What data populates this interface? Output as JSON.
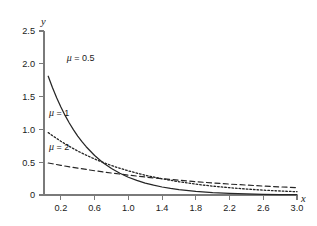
{
  "chart_data": {
    "type": "line",
    "title": "",
    "subtitle": "",
    "xlabel": "x",
    "ylabel": "y",
    "xlim": [
      0,
      3.0
    ],
    "ylim": [
      0,
      2.5
    ],
    "grid": false,
    "legend_position": "inline-annotations",
    "x_ticks": [
      0.2,
      0.6,
      1.0,
      1.4,
      1.8,
      2.2,
      2.6,
      3.0
    ],
    "x_tick_labels": [
      "0.2",
      "0.6",
      "1.0",
      "1.4",
      "1.8",
      "2.2",
      "2.6",
      "3.0"
    ],
    "y_ticks": [
      0,
      0.5,
      1.0,
      1.5,
      2.0,
      2.5
    ],
    "y_tick_labels": [
      "0",
      "0.5",
      "1.0",
      "1.5",
      "2.0",
      "2.5"
    ],
    "annotations": [
      {
        "text": "μ = 0.5",
        "mu_symbol": "μ",
        "rest": " = 0.5",
        "x": 0.27,
        "y": 2.05
      },
      {
        "text": "μ = 1",
        "mu_symbol": "μ",
        "rest": " = 1",
        "x": 0.06,
        "y": 1.2
      },
      {
        "text": "μ = 2",
        "mu_symbol": "μ",
        "rest": " = 2",
        "x": 0.06,
        "y": 0.68
      }
    ],
    "series": [
      {
        "name": "μ = 0.5",
        "style": "solid",
        "mu": 0.5,
        "x": [
          0.05,
          0.1,
          0.15,
          0.2,
          0.25,
          0.3,
          0.35,
          0.4,
          0.45,
          0.5,
          0.6,
          0.7,
          0.8,
          0.9,
          1.0,
          1.1,
          1.2,
          1.3,
          1.4,
          1.5,
          1.6,
          1.8,
          2.0,
          2.2,
          2.4,
          2.6,
          2.8,
          3.0
        ],
        "values": [
          1.81,
          1.638,
          1.482,
          1.341,
          1.213,
          1.098,
          0.993,
          0.899,
          0.813,
          0.736,
          0.602,
          0.493,
          0.404,
          0.331,
          0.271,
          0.222,
          0.181,
          0.149,
          0.122,
          0.1,
          0.082,
          0.055,
          0.037,
          0.025,
          0.016,
          0.011,
          0.007,
          0.005
        ]
      },
      {
        "name": "μ = 1",
        "style": "dotted",
        "mu": 1,
        "x": [
          0.05,
          0.1,
          0.2,
          0.3,
          0.4,
          0.5,
          0.6,
          0.7,
          0.8,
          0.9,
          1.0,
          1.2,
          1.4,
          1.6,
          1.8,
          2.0,
          2.2,
          2.4,
          2.6,
          2.8,
          3.0
        ],
        "values": [
          0.951,
          0.905,
          0.819,
          0.741,
          0.67,
          0.607,
          0.549,
          0.497,
          0.449,
          0.407,
          0.368,
          0.301,
          0.247,
          0.202,
          0.165,
          0.135,
          0.111,
          0.091,
          0.074,
          0.061,
          0.05
        ]
      },
      {
        "name": "μ = 2",
        "style": "dashed",
        "mu": 2,
        "x": [
          0.05,
          0.1,
          0.2,
          0.4,
          0.6,
          0.8,
          1.0,
          1.2,
          1.4,
          1.6,
          1.8,
          2.0,
          2.2,
          2.4,
          2.6,
          2.8,
          3.0
        ],
        "values": [
          0.488,
          0.476,
          0.452,
          0.409,
          0.37,
          0.335,
          0.303,
          0.274,
          0.248,
          0.225,
          0.203,
          0.184,
          0.166,
          0.151,
          0.136,
          0.123,
          0.112
        ]
      }
    ]
  }
}
